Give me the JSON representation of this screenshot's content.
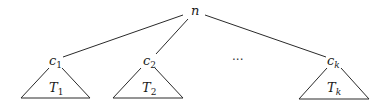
{
  "diagram": {
    "type": "tree",
    "root": {
      "label": "n"
    },
    "children": [
      {
        "label": "c",
        "sub": "1",
        "subtree": {
          "label": "T",
          "sub": "1"
        }
      },
      {
        "label": "c",
        "sub": "2",
        "subtree": {
          "label": "T",
          "sub": "2"
        }
      },
      {
        "label": "c",
        "sub": "k",
        "subtree": {
          "label": "T",
          "sub": "k"
        }
      }
    ],
    "ellipsis": "···"
  }
}
